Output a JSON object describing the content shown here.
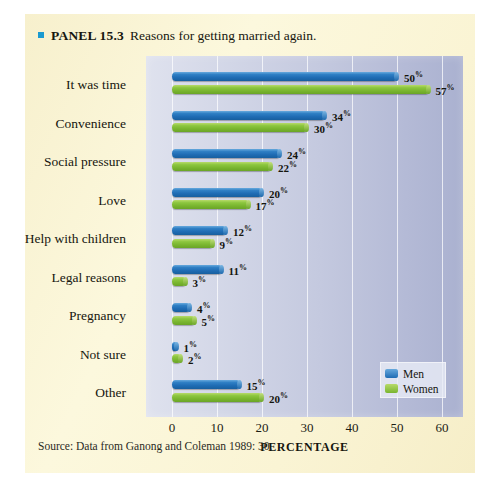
{
  "panel": {
    "bullet_icon": "square-bullet-icon",
    "label": "PANEL 15.3",
    "title": "Reasons for getting married again.",
    "source": "Source: Data from Ganong and Coleman 1989: 30."
  },
  "legend": {
    "items": [
      {
        "name": "Men",
        "color": "#1f6cb4"
      },
      {
        "name": "Women",
        "color": "#79b52f"
      }
    ]
  },
  "chart_data": {
    "type": "bar",
    "orientation": "horizontal",
    "title": "Reasons for getting married again.",
    "xlabel": "PERCENTAGE",
    "ylabel": "",
    "xlim": [
      0,
      60
    ],
    "xticks": [
      0,
      10,
      20,
      30,
      40,
      50,
      60
    ],
    "grid": true,
    "legend_position": "inside-lower-right",
    "categories": [
      "It was time",
      "Convenience",
      "Social pressure",
      "Love",
      "Help with children",
      "Legal reasons",
      "Pregnancy",
      "Not sure",
      "Other"
    ],
    "series": [
      {
        "name": "Men",
        "color": "#1f6cb4",
        "values": [
          50,
          34,
          24,
          20,
          12,
          11,
          4,
          1,
          15
        ],
        "labels": [
          "50%",
          "34%",
          "24%",
          "20%",
          "12%",
          "11%",
          "4%",
          "1%",
          "15%"
        ]
      },
      {
        "name": "Women",
        "color": "#79b52f",
        "values": [
          57,
          30,
          22,
          17,
          9,
          3,
          5,
          2,
          20
        ],
        "labels": [
          "57%",
          "30%",
          "22%",
          "17%",
          "9%",
          "3%",
          "5%",
          "2%",
          "20%"
        ]
      }
    ]
  }
}
